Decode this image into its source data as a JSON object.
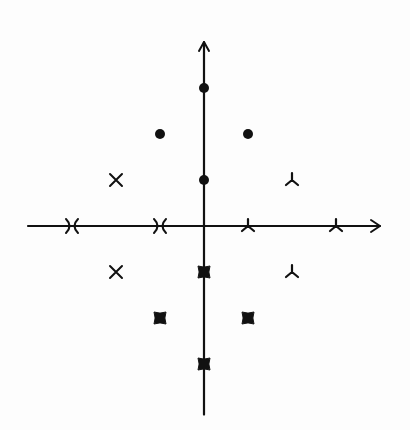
{
  "diagram": {
    "ink_color": "#111111",
    "background_color": "#fdfdfd",
    "origin_px": [
      204,
      226
    ],
    "unit_px": [
      44,
      46
    ],
    "axes": {
      "x": {
        "from": -4,
        "to": 4,
        "arrow": "right"
      },
      "y": {
        "from": -4.1,
        "to": 4,
        "arrow": "up"
      }
    },
    "marker_groups": [
      {
        "name": "circles",
        "shape": "filled-circle",
        "points": [
          [
            0,
            3
          ],
          [
            -1,
            2
          ],
          [
            1,
            2
          ],
          [
            0,
            1
          ]
        ]
      },
      {
        "name": "crosses",
        "shape": "x-cross",
        "points": [
          [
            -2,
            1
          ],
          [
            -2,
            -1
          ]
        ]
      },
      {
        "name": "axis-crosses",
        "shape": "arrow-cross",
        "points": [
          [
            -3,
            0
          ],
          [
            -1,
            0
          ]
        ]
      },
      {
        "name": "tristars",
        "shape": "tri-star",
        "points": [
          [
            2,
            1
          ],
          [
            2,
            -1
          ],
          [
            1,
            0
          ],
          [
            3,
            0
          ]
        ]
      },
      {
        "name": "notched-squares",
        "shape": "notched-square",
        "points": [
          [
            0,
            -1
          ],
          [
            -1,
            -2
          ],
          [
            1,
            -2
          ],
          [
            0,
            -3
          ]
        ]
      }
    ]
  }
}
